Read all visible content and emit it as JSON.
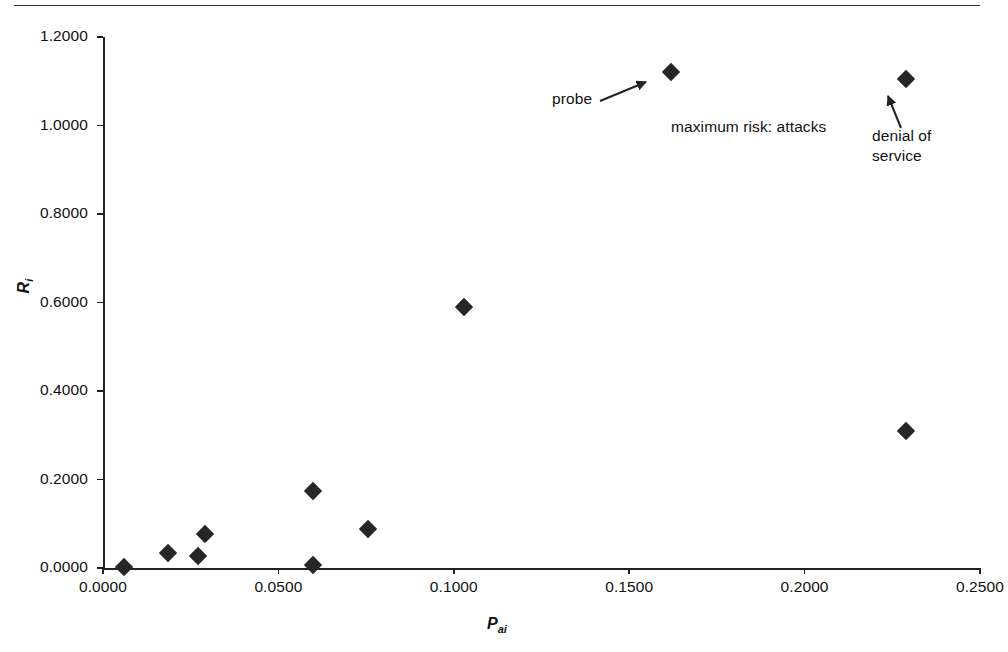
{
  "page": {
    "top_rule": "horizontal-rule",
    "background": "#ffffff",
    "marker_color": "#262626",
    "axis_color": "#222222"
  },
  "chart_data": {
    "type": "scatter",
    "title": "",
    "subtitle": "",
    "xlabel": "P",
    "xlabel_sub": "ai",
    "ylabel": "R",
    "ylabel_sub": "i",
    "xlim": [
      0.0,
      0.25
    ],
    "ylim": [
      0.0,
      1.2
    ],
    "grid": false,
    "legend": "none",
    "xticks": [
      "0.0000",
      "0.0500",
      "0.1000",
      "0.1500",
      "0.2000",
      "0.2500"
    ],
    "xtick_values": [
      0.0,
      0.05,
      0.1,
      0.15,
      0.2,
      0.25
    ],
    "yticks": [
      "0.0000",
      "0.2000",
      "0.4000",
      "0.6000",
      "0.8000",
      "1.0000",
      "1.2000"
    ],
    "ytick_values": [
      0.0,
      0.2,
      0.4,
      0.6,
      0.8,
      1.0,
      1.2
    ],
    "series": [
      {
        "name": "risk",
        "marker": "diamond",
        "color": "#262626",
        "points": [
          {
            "x": 0.006,
            "y": 0.003
          },
          {
            "x": 0.0185,
            "y": 0.034
          },
          {
            "x": 0.027,
            "y": 0.026
          },
          {
            "x": 0.0292,
            "y": 0.077
          },
          {
            "x": 0.0598,
            "y": 0.1745
          },
          {
            "x": 0.06,
            "y": 0.006
          },
          {
            "x": 0.0755,
            "y": 0.089
          },
          {
            "x": 0.103,
            "y": 0.59
          },
          {
            "x": 0.162,
            "y": 1.12
          },
          {
            "x": 0.229,
            "y": 1.105
          },
          {
            "x": 0.229,
            "y": 0.31
          }
        ]
      }
    ],
    "annotations": [
      {
        "id": "probe",
        "text": "probe",
        "target_x": 0.162,
        "target_y": 1.12
      },
      {
        "id": "maximum-risk",
        "text": "maximum risk: attacks",
        "target_x": null,
        "target_y": null
      },
      {
        "id": "denial-of-service",
        "text": "denial of service",
        "target_x": 0.229,
        "target_y": 1.105
      }
    ]
  }
}
